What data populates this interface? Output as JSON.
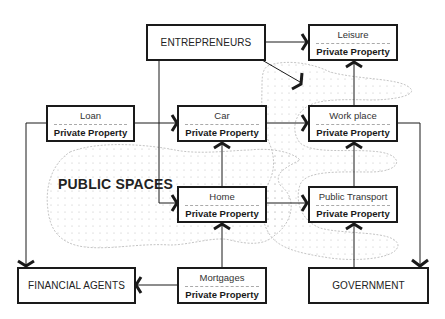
{
  "diagram": {
    "region_label": "PUBLIC SPACES",
    "nodes": {
      "entrepreneurs": {
        "label": "ENTREPRENEURS"
      },
      "leisure": {
        "label": "Leisure",
        "sublabel": "Private Property"
      },
      "loan": {
        "label": "Loan",
        "sublabel": "Private Property"
      },
      "car": {
        "label": "Car",
        "sublabel": "Private Property"
      },
      "workplace": {
        "label": "Work place",
        "sublabel": "Private Property"
      },
      "home": {
        "label": "Home",
        "sublabel": "Private Property"
      },
      "public_transport": {
        "label": "Public Transport",
        "sublabel": "Private Property"
      },
      "financial_agents": {
        "label": "FINANCIAL AGENTS"
      },
      "mortgages": {
        "label": "Mortgages",
        "sublabel": "Private Property"
      },
      "government": {
        "label": "GOVERNMENT"
      }
    },
    "edges": [
      {
        "from": "entrepreneurs",
        "to": "leisure"
      },
      {
        "from": "entrepreneurs",
        "to": "public_spaces"
      },
      {
        "from": "entrepreneurs",
        "to": "home"
      },
      {
        "from": "loan",
        "to": "car"
      },
      {
        "from": "loan",
        "to": "financial_agents"
      },
      {
        "from": "car",
        "to": "workplace"
      },
      {
        "from": "home",
        "to": "car"
      },
      {
        "from": "home",
        "to": "public_transport"
      },
      {
        "from": "workplace",
        "to": "leisure"
      },
      {
        "from": "workplace",
        "to": "government"
      },
      {
        "from": "public_transport",
        "to": "workplace"
      },
      {
        "from": "government",
        "to": "public_transport"
      },
      {
        "from": "mortgages",
        "to": "home"
      },
      {
        "from": "mortgages",
        "to": "financial_agents"
      }
    ],
    "colors": {
      "line": "#1a1a1a",
      "blob_outline": "#b5b5b5",
      "blob_dots": "#c8c8c8"
    }
  }
}
